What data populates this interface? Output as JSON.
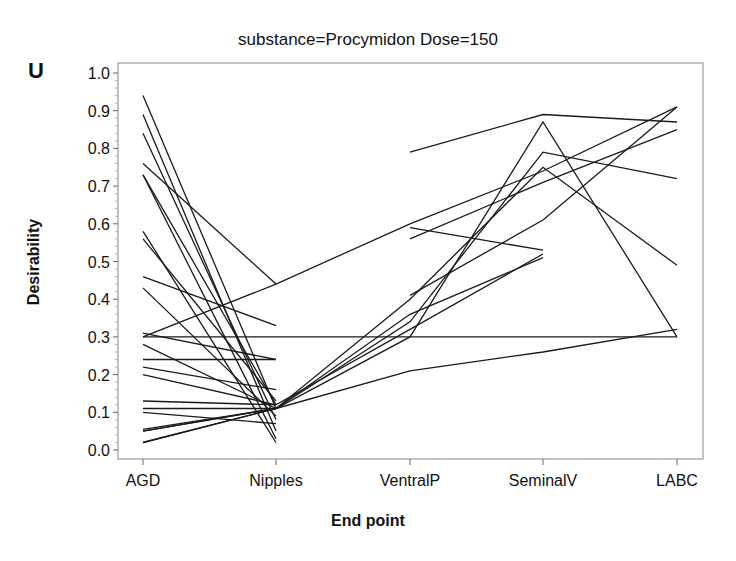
{
  "chart_data": {
    "type": "line",
    "title": "substance=Procymidon  Dose=150",
    "panel_label": "U",
    "xlabel": "End point",
    "ylabel": "Desirability",
    "categories": [
      "AGD",
      "Nipples",
      "VentralP",
      "SeminalV",
      "LABC"
    ],
    "yticks": [
      "0.0",
      "0.1",
      "0.2",
      "0.3",
      "0.4",
      "0.5",
      "0.6",
      "0.7",
      "0.8",
      "0.9",
      "1.0"
    ],
    "ylim": [
      0,
      1.0
    ],
    "grid": false,
    "legend": null,
    "series": [
      {
        "name": "s1",
        "values": [
          0.94,
          0.11,
          null,
          null,
          null
        ]
      },
      {
        "name": "s2",
        "values": [
          0.89,
          0.05,
          null,
          null,
          null
        ]
      },
      {
        "name": "s3",
        "values": [
          0.84,
          0.08,
          null,
          null,
          null
        ]
      },
      {
        "name": "s4",
        "values": [
          0.76,
          0.44,
          null,
          null,
          null
        ]
      },
      {
        "name": "s5",
        "values": [
          0.73,
          0.12,
          null,
          null,
          null
        ]
      },
      {
        "name": "s6",
        "values": [
          0.73,
          0.03,
          null,
          null,
          null
        ]
      },
      {
        "name": "s7",
        "values": [
          0.58,
          0.02,
          null,
          null,
          null
        ]
      },
      {
        "name": "s8",
        "values": [
          0.56,
          0.13,
          null,
          null,
          null
        ]
      },
      {
        "name": "s9",
        "values": [
          0.46,
          0.33,
          null,
          null,
          null
        ]
      },
      {
        "name": "s10",
        "values": [
          0.43,
          0.09,
          null,
          null,
          null
        ]
      },
      {
        "name": "s11",
        "values": [
          0.31,
          0.24,
          null,
          null,
          null
        ]
      },
      {
        "name": "s12",
        "values": [
          0.3,
          0.44,
          0.6,
          0.74,
          0.91
        ]
      },
      {
        "name": "s13",
        "values": [
          0.3,
          0.3,
          0.3,
          0.3,
          0.3
        ]
      },
      {
        "name": "s14",
        "values": [
          0.28,
          0.11,
          null,
          null,
          null
        ]
      },
      {
        "name": "s15",
        "values": [
          0.24,
          0.24,
          null,
          null,
          null
        ]
      },
      {
        "name": "s16",
        "values": [
          0.22,
          0.16,
          null,
          null,
          null
        ]
      },
      {
        "name": "s17",
        "values": [
          0.2,
          0.12,
          null,
          null,
          null
        ]
      },
      {
        "name": "s18",
        "values": [
          0.13,
          0.12,
          null,
          null,
          null
        ]
      },
      {
        "name": "s19",
        "values": [
          0.11,
          0.11,
          null,
          null,
          null
        ]
      },
      {
        "name": "s20",
        "values": [
          0.1,
          0.07,
          null,
          null,
          null
        ]
      },
      {
        "name": "s21",
        "values": [
          0.055,
          0.11,
          0.3,
          0.87,
          0.3
        ]
      },
      {
        "name": "s22",
        "values": [
          0.05,
          0.11,
          0.34,
          0.79,
          0.72
        ]
      },
      {
        "name": "s23",
        "values": [
          0.02,
          0.11,
          0.4,
          0.75,
          0.49
        ]
      },
      {
        "name": "s24",
        "values": [
          0.02,
          0.11,
          0.21,
          0.26,
          0.32
        ]
      },
      {
        "name": "s25",
        "values": [
          0.05,
          0.11,
          0.36,
          0.51,
          null
        ]
      },
      {
        "name": "s26",
        "values": [
          null,
          0.12,
          0.32,
          0.52,
          null
        ]
      },
      {
        "name": "s27",
        "values": [
          null,
          null,
          0.79,
          0.89,
          0.87
        ]
      },
      {
        "name": "s28",
        "values": [
          null,
          null,
          0.59,
          0.53,
          null
        ]
      },
      {
        "name": "s29",
        "values": [
          null,
          null,
          0.56,
          0.71,
          0.85
        ]
      },
      {
        "name": "s30",
        "values": [
          null,
          null,
          0.41,
          0.61,
          0.91
        ]
      }
    ]
  }
}
